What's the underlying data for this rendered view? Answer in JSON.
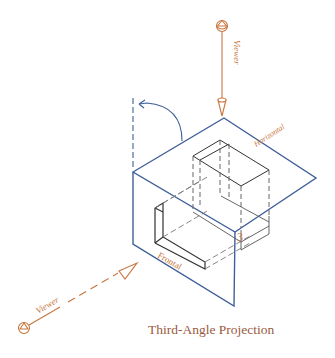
{
  "title": "Third-Angle Projection",
  "labels": {
    "viewer_top": "Viewer",
    "viewer_left": "Viewer",
    "horizontal_plane": "Horizontal",
    "frontal_plane": "Frontal",
    "dimension": "3"
  },
  "icons": {
    "viewer_eye_top": "viewer-eye-icon",
    "viewer_eye_left": "viewer-eye-icon",
    "rotation_arrow": "rotation-arc-arrow"
  },
  "colors": {
    "plane_line": "#3f5f9a",
    "annotation": "#c8763e",
    "caption": "#9a5a3e",
    "object_line": "#333333",
    "hidden_line": "#666666"
  }
}
